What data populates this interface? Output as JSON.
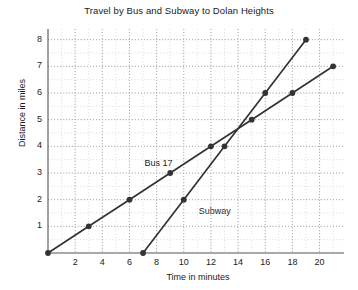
{
  "chart_data": {
    "type": "line",
    "title": "Travel by Bus and Subway to Dolan Heights",
    "xlabel": "Time in minutes",
    "ylabel": "Distance in miles",
    "xlim": [
      0,
      21.8
    ],
    "ylim": [
      0,
      8.4
    ],
    "xticks": [
      2,
      4,
      6,
      8,
      10,
      12,
      14,
      16,
      18,
      20
    ],
    "yticks": [
      1,
      2,
      3,
      4,
      5,
      6,
      7,
      8
    ],
    "grid": true,
    "grid_style": "dotted",
    "grid_major_x_step": 2,
    "grid_minor_x_step": 1,
    "grid_major_y_step": 1,
    "grid_minor_y_step": 0.5,
    "legend_position": "inline-annotations",
    "line_color": "#333333",
    "marker": "circle",
    "series": [
      {
        "name": "Bus 17",
        "label": "Bus 17",
        "color": "#333333",
        "points": [
          {
            "x": 0,
            "y": 0
          },
          {
            "x": 3,
            "y": 1
          },
          {
            "x": 6,
            "y": 2
          },
          {
            "x": 9,
            "y": 3
          },
          {
            "x": 12,
            "y": 4
          },
          {
            "x": 15,
            "y": 5
          },
          {
            "x": 18,
            "y": 6
          },
          {
            "x": 21,
            "y": 7
          }
        ],
        "annotation": {
          "text": "Bus 17",
          "x": 7.1,
          "y": 3.35
        }
      },
      {
        "name": "Subway",
        "label": "Subway",
        "color": "#333333",
        "points": [
          {
            "x": 7,
            "y": 0
          },
          {
            "x": 10,
            "y": 2
          },
          {
            "x": 13,
            "y": 4
          },
          {
            "x": 16,
            "y": 6
          },
          {
            "x": 19,
            "y": 8
          }
        ],
        "annotation": {
          "text": "Subway",
          "x": 11.1,
          "y": 1.55
        }
      }
    ]
  },
  "axes": {
    "axis_color": "#555555",
    "grid_color": "#c9c9c9"
  }
}
